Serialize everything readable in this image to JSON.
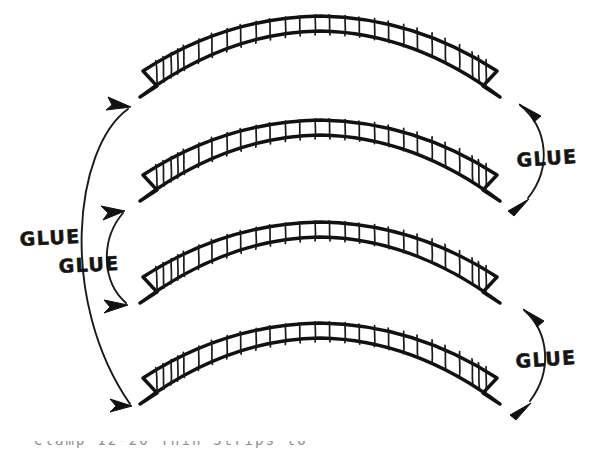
{
  "figure": {
    "background_color": "#ffffff",
    "ink_color": "#111111",
    "width": 608,
    "height": 453,
    "style": "hand-drawn line illustration"
  },
  "labels": {
    "glue_right_upper": "GLUE",
    "glue_left_outer": "GLUE",
    "glue_left_inner": "GLUE",
    "glue_right_lower": "GLUE"
  },
  "beams": [
    {
      "index": 1,
      "name": "arch-segment-top",
      "grain_count": 27,
      "description": "curved laminated arch segment with vertical wood grain hatching and V-notched ends"
    },
    {
      "index": 2,
      "name": "arch-segment-second",
      "grain_count": 27,
      "description": "curved laminated arch segment with vertical wood grain hatching and V-notched ends"
    },
    {
      "index": 3,
      "name": "arch-segment-third",
      "grain_count": 27,
      "description": "curved laminated arch segment with vertical wood grain hatching and V-notched ends"
    },
    {
      "index": 4,
      "name": "arch-segment-bottom",
      "grain_count": 27,
      "description": "curved laminated arch segment with vertical wood grain hatching and V-notched ends"
    }
  ],
  "connectors": [
    {
      "name": "glue-arc-right-upper",
      "side": "right",
      "connects": [
        1,
        2
      ],
      "arrowheads": "both-ends",
      "label": "GLUE"
    },
    {
      "name": "glue-arc-left-outer",
      "side": "left",
      "connects": [
        1,
        4
      ],
      "arrowheads": "both-ends",
      "label": "GLUE"
    },
    {
      "name": "glue-arc-left-inner",
      "side": "left",
      "connects": [
        2,
        3
      ],
      "arrowheads": "both-ends",
      "label": "GLUE"
    },
    {
      "name": "glue-arc-right-lower",
      "side": "right",
      "connects": [
        3,
        4
      ],
      "arrowheads": "both-ends",
      "label": "GLUE"
    }
  ],
  "caption": {
    "text": "Clamp 12-20 Thin Strips to",
    "note": "clipped at bottom edge of image"
  }
}
